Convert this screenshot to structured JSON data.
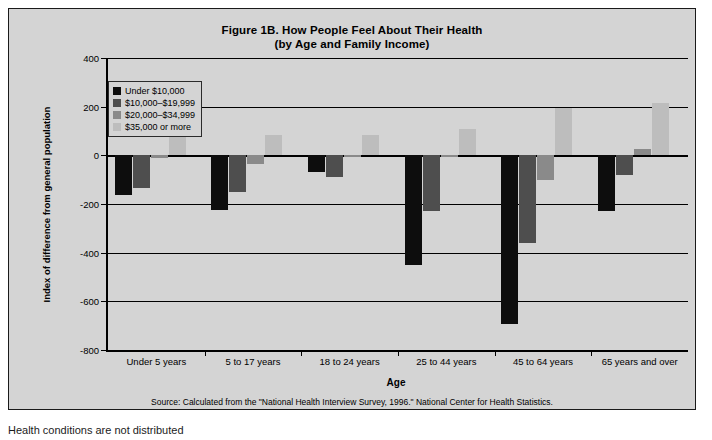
{
  "chart_data": {
    "type": "bar",
    "title": "Figure 1B. How People Feel About Their Health",
    "subtitle": "(by Age and Family Income)",
    "xlabel": "Age",
    "ylabel": "Index of difference from general population",
    "ylim": [
      -800,
      400
    ],
    "ytick_step": 200,
    "yticks": [
      400,
      200,
      0,
      -200,
      -400,
      -600,
      -800
    ],
    "ytick_labels": [
      "400",
      "200",
      "0",
      "-200",
      "-400",
      "-600",
      "-800"
    ],
    "grid": true,
    "legend_position": "upper-left-inside",
    "categories": [
      "Under 5 years",
      "5 to 17 years",
      "18 to 24 years",
      "25 to 44 years",
      "45 to 64 years",
      "65 years and over"
    ],
    "series": [
      {
        "name": "Under $10,000",
        "color": "#0d0d0d",
        "values": [
          -165,
          -225,
          -70,
          -450,
          -695,
          -230
        ]
      },
      {
        "name": "$10,000–$19,999",
        "color": "#4e4e4e",
        "values": [
          -135,
          -150,
          -90,
          -230,
          -360,
          -80
        ]
      },
      {
        "name": "$20,000–$34,999",
        "color": "#8a8a8a",
        "values": [
          -10,
          -35,
          -5,
          -5,
          -100,
          25
        ]
      },
      {
        "name": "$35,000 or more",
        "color": "#bdbdbd",
        "values": [
          85,
          85,
          85,
          110,
          195,
          215
        ]
      }
    ],
    "source": "Source: Calculated from the \"National Health Interview Survey, 1996.\"  National Center for Health Statistics."
  },
  "page": {
    "below_text": "Health conditions are not distributed"
  }
}
